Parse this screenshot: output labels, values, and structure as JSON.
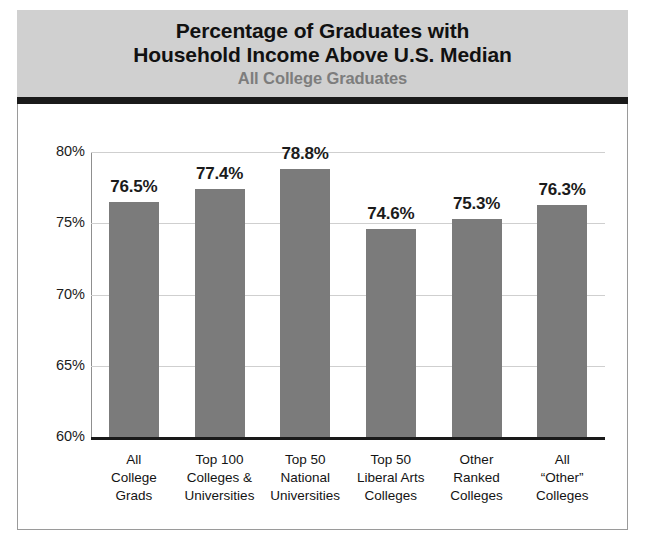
{
  "header": {
    "title": "Percentage of Graduates with\nHousehold Income Above U.S. Median",
    "subtitle": "All College Graduates"
  },
  "chart_data": {
    "type": "bar",
    "title": "Percentage of Graduates with Household Income Above U.S. Median",
    "subtitle": "All College Graduates",
    "xlabel": "",
    "ylabel": "",
    "ylim": [
      60,
      80
    ],
    "grid": true,
    "legend": "none",
    "yticks": [
      "60%",
      "65%",
      "70%",
      "75%",
      "80%"
    ],
    "ytick_values": [
      60,
      65,
      70,
      75,
      80
    ],
    "categories": [
      "All\nCollege\nGrads",
      "Top 100\nColleges &\nUniversities",
      "Top 50\nNational\nUniversities",
      "Top 50\nLiberal Arts\nColleges",
      "Other\nRanked\nColleges",
      "All\n“Other”\nColleges"
    ],
    "values": [
      76.5,
      77.4,
      78.8,
      74.6,
      75.3,
      76.3
    ],
    "value_labels": [
      "76.5%",
      "77.4%",
      "78.8%",
      "74.6%",
      "75.3%",
      "76.3%"
    ],
    "bar_color": "#7b7b7b",
    "axis_color": "#1a1a1a",
    "grid_color": "#cfcfcf",
    "header_band_color": "#d0d0d0",
    "subtitle_color": "#7d7d7d"
  }
}
